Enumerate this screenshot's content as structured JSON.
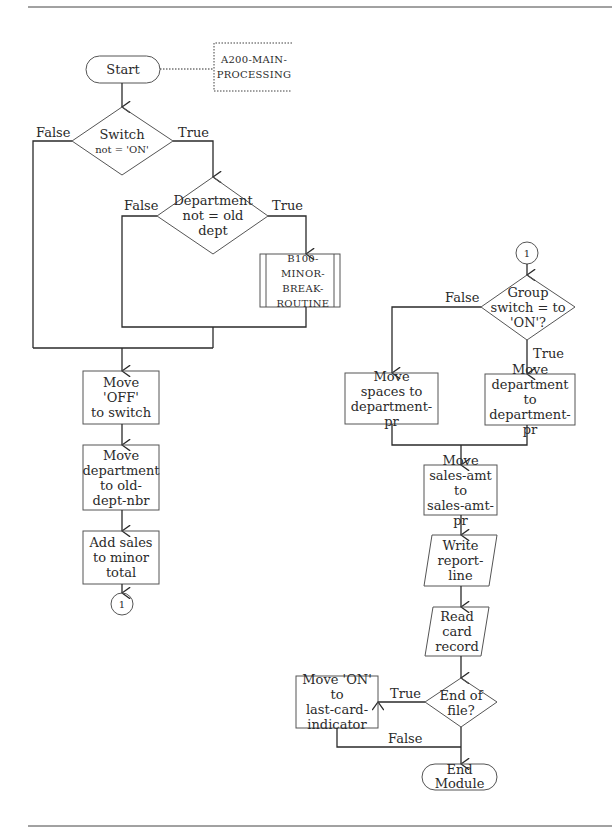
{
  "left_flow": {
    "start": "Start",
    "annotation": "A200-MAIN-\nPROCESSING",
    "decision_switch": {
      "line1": "Switch",
      "line2": "not = 'ON'",
      "false_label": "False",
      "true_label": "True"
    },
    "decision_department": {
      "text": "Department\nnot = old\ndept",
      "false_label": "False",
      "true_label": "True"
    },
    "subroutine": "B100-MINOR-\nBREAK-\nROUTINE",
    "process_move_off": "Move 'OFF'\nto switch",
    "process_move_department": "Move\ndepartment\nto old-\ndept-nbr",
    "process_add_sales": "Add sales\nto minor\ntotal",
    "connector_out": "1"
  },
  "right_flow": {
    "connector_in": "1",
    "decision_group_switch": {
      "text": "Group\nswitch = to\n'ON'?",
      "false_label": "False",
      "true_label": "True"
    },
    "process_move_spaces": "Move\nspaces to\ndepartment-pr",
    "process_move_department_pr": "Move\ndepartment to\ndepartment-pr",
    "process_move_sales_amt": "Move\nsales-amt to\nsales-amt-pr",
    "io_write": "Write\nreport-\nline",
    "io_read": "Read card\nrecord",
    "decision_eof": {
      "text": "End of\nfile?",
      "true_label": "True",
      "false_label": "False"
    },
    "process_move_on": "Move 'ON' to\nlast-card-\nindicator",
    "end": "End\nModule"
  },
  "colors": {
    "line": "#2a2a2a",
    "shape_border": "#555555",
    "background": "#ffffff"
  }
}
